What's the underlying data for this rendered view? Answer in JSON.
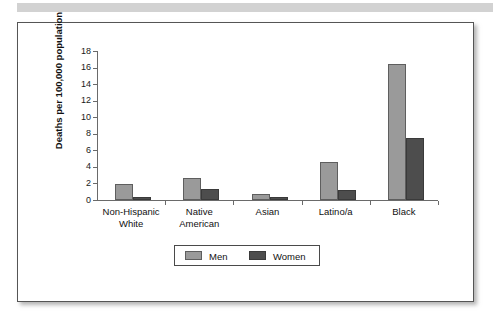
{
  "figure": {
    "top_band_color": "#d2d2d2",
    "frame_border_color": "#555555",
    "background": "#ffffff"
  },
  "chart_data": {
    "type": "bar",
    "title": "",
    "xlabel": "",
    "ylabel": "Deaths per 100,000 population",
    "ylim": [
      0,
      18
    ],
    "ytick_step": 2,
    "yticks": [
      "0",
      "2",
      "4",
      "6",
      "8",
      "10",
      "12",
      "14",
      "16",
      "18"
    ],
    "grid": false,
    "legend_position": "bottom-center",
    "categories": [
      "Non-Hispanic\nWhite",
      "Native\nAmerican",
      "Asian",
      "Latino/a",
      "Black"
    ],
    "series": [
      {
        "name": "Men",
        "color": "#9a9a9a",
        "values": [
          1.9,
          2.6,
          0.75,
          4.6,
          16.4
        ]
      },
      {
        "name": "Women",
        "color": "#4d4d4d",
        "values": [
          0.35,
          1.3,
          0.35,
          1.2,
          7.5
        ]
      }
    ]
  },
  "legend": {
    "entries": [
      {
        "label": "Men",
        "swatch": "men"
      },
      {
        "label": "Women",
        "swatch": "women"
      }
    ]
  }
}
